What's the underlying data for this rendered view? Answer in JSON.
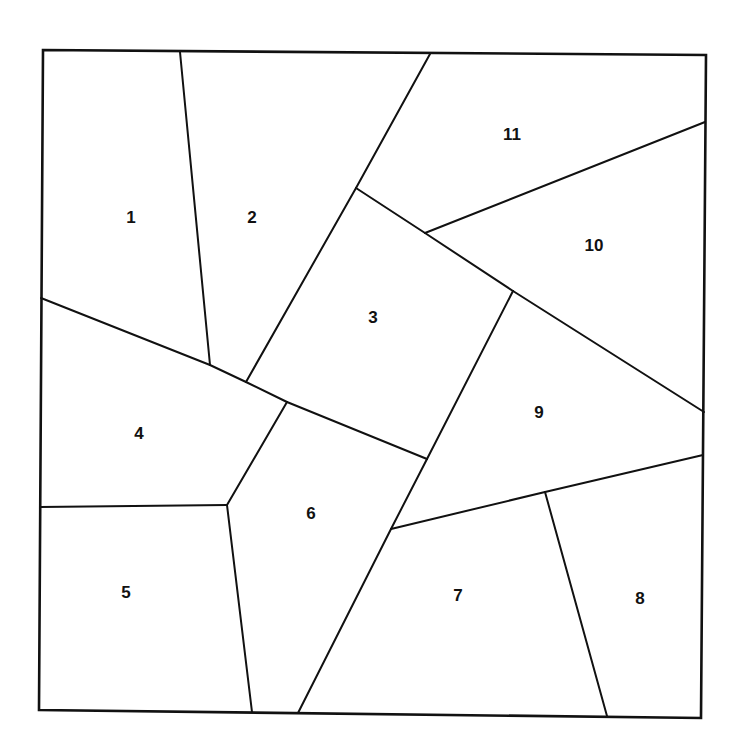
{
  "diagram": {
    "type": "planar-partition",
    "colors": {
      "line": "#111111",
      "fill": "#ffffff",
      "label": "#111111"
    },
    "frame": [
      [
        43,
        50
      ],
      [
        706,
        55
      ],
      [
        701,
        718
      ],
      [
        39,
        710
      ]
    ],
    "regions": [
      {
        "id": "1",
        "label": "1",
        "label_pos": [
          131,
          217
        ],
        "polygon": [
          [
            43,
            50
          ],
          [
            180,
            52
          ],
          [
            210,
            365
          ],
          [
            41,
            298
          ]
        ]
      },
      {
        "id": "2",
        "label": "2",
        "label_pos": [
          252,
          217
        ],
        "polygon": [
          [
            180,
            52
          ],
          [
            430,
            54
          ],
          [
            356,
            188
          ],
          [
            246,
            382
          ],
          [
            210,
            365
          ]
        ]
      },
      {
        "id": "3",
        "label": "3",
        "label_pos": [
          373,
          317
        ],
        "polygon": [
          [
            356,
            188
          ],
          [
            425,
            233
          ],
          [
            513,
            291
          ],
          [
            427,
            459
          ],
          [
            287,
            402
          ],
          [
            246,
            382
          ]
        ]
      },
      {
        "id": "4",
        "label": "4",
        "label_pos": [
          139,
          433
        ],
        "polygon": [
          [
            41,
            298
          ],
          [
            210,
            365
          ],
          [
            246,
            382
          ],
          [
            287,
            402
          ],
          [
            227,
            505
          ],
          [
            40,
            507
          ]
        ]
      },
      {
        "id": "5",
        "label": "5",
        "label_pos": [
          126,
          592
        ],
        "polygon": [
          [
            40,
            507
          ],
          [
            227,
            505
          ],
          [
            252,
            712
          ],
          [
            39,
            710
          ]
        ]
      },
      {
        "id": "6",
        "label": "6",
        "label_pos": [
          311,
          513
        ],
        "polygon": [
          [
            287,
            402
          ],
          [
            427,
            459
          ],
          [
            391,
            529
          ],
          [
            298,
            713
          ],
          [
            252,
            712
          ],
          [
            227,
            505
          ]
        ]
      },
      {
        "id": "7",
        "label": "7",
        "label_pos": [
          458,
          595
        ],
        "polygon": [
          [
            391,
            529
          ],
          [
            545,
            492
          ],
          [
            607,
            716
          ],
          [
            298,
            713
          ]
        ]
      },
      {
        "id": "8",
        "label": "8",
        "label_pos": [
          640,
          598
        ],
        "polygon": [
          [
            545,
            492
          ],
          [
            703,
            455
          ],
          [
            701,
            718
          ],
          [
            607,
            716
          ]
        ]
      },
      {
        "id": "9",
        "label": "9",
        "label_pos": [
          539,
          412
        ],
        "polygon": [
          [
            513,
            291
          ],
          [
            704,
            412
          ],
          [
            703,
            455
          ],
          [
            545,
            492
          ],
          [
            391,
            529
          ],
          [
            427,
            459
          ]
        ]
      },
      {
        "id": "10",
        "label": "10",
        "label_pos": [
          594,
          245
        ],
        "polygon": [
          [
            425,
            233
          ],
          [
            705,
            122
          ],
          [
            704,
            412
          ],
          [
            513,
            291
          ]
        ]
      },
      {
        "id": "11",
        "label": "11",
        "label_pos": [
          512,
          134
        ],
        "polygon": [
          [
            430,
            54
          ],
          [
            706,
            55
          ],
          [
            705,
            122
          ],
          [
            425,
            233
          ],
          [
            356,
            188
          ]
        ]
      }
    ],
    "edges": [
      {
        "name": "edge-1-2",
        "from": [
          180,
          52
        ],
        "to": [
          210,
          365
        ]
      },
      {
        "name": "edge-2-11",
        "from": [
          430,
          54
        ],
        "to": [
          356,
          188
        ]
      },
      {
        "name": "edge-2-3",
        "from": [
          356,
          188
        ],
        "to": [
          246,
          382
        ]
      },
      {
        "name": "edge-1-4",
        "from": [
          41,
          298
        ],
        "to": [
          210,
          365
        ]
      },
      {
        "name": "edge-2-4",
        "from": [
          210,
          365
        ],
        "to": [
          246,
          382
        ]
      },
      {
        "name": "edge-3-4",
        "from": [
          246,
          382
        ],
        "to": [
          287,
          402
        ]
      },
      {
        "name": "edge-3-6",
        "from": [
          287,
          402
        ],
        "to": [
          427,
          459
        ]
      },
      {
        "name": "edge-4-6",
        "from": [
          287,
          402
        ],
        "to": [
          227,
          505
        ]
      },
      {
        "name": "edge-4-5",
        "from": [
          40,
          507
        ],
        "to": [
          227,
          505
        ]
      },
      {
        "name": "edge-5-6",
        "from": [
          227,
          505
        ],
        "to": [
          252,
          712
        ]
      },
      {
        "name": "edge-3-11",
        "from": [
          356,
          188
        ],
        "to": [
          425,
          233
        ]
      },
      {
        "name": "edge-3-10",
        "from": [
          425,
          233
        ],
        "to": [
          513,
          291
        ]
      },
      {
        "name": "edge-9-10",
        "from": [
          513,
          291
        ],
        "to": [
          704,
          412
        ]
      },
      {
        "name": "edge-10-11",
        "from": [
          425,
          233
        ],
        "to": [
          705,
          122
        ]
      },
      {
        "name": "edge-3-9",
        "from": [
          513,
          291
        ],
        "to": [
          427,
          459
        ]
      },
      {
        "name": "edge-6-9",
        "from": [
          427,
          459
        ],
        "to": [
          391,
          529
        ]
      },
      {
        "name": "edge-6-7",
        "from": [
          391,
          529
        ],
        "to": [
          298,
          713
        ]
      },
      {
        "name": "edge-7-9",
        "from": [
          391,
          529
        ],
        "to": [
          545,
          492
        ]
      },
      {
        "name": "edge-8-9",
        "from": [
          545,
          492
        ],
        "to": [
          703,
          455
        ]
      },
      {
        "name": "edge-7-8",
        "from": [
          545,
          492
        ],
        "to": [
          607,
          716
        ]
      }
    ]
  }
}
